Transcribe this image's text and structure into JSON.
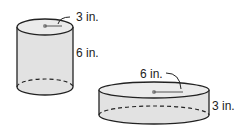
{
  "figure": {
    "cylinder_a": {
      "radius_label": "3 in.",
      "height_label": "6 in."
    },
    "cylinder_b": {
      "radius_label": "6 in.",
      "height_label": "3 in."
    },
    "colors": {
      "fill": "#e2e2e2",
      "top_fill": "#ebebeb",
      "stroke": "#222222",
      "center_dot": "#888888"
    }
  }
}
